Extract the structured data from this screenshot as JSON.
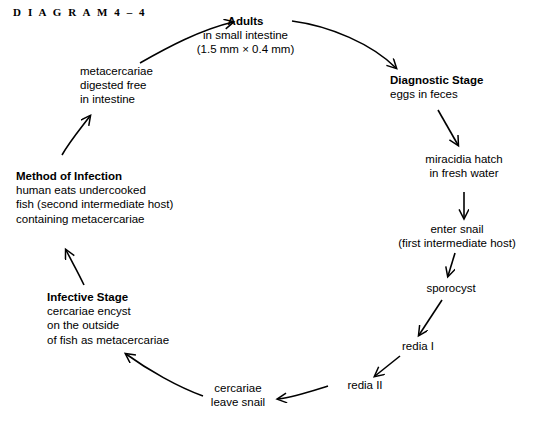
{
  "figure": {
    "label": "D I A G R A M   4 – 4"
  },
  "colors": {
    "background": "#ffffff",
    "ink": "#000000"
  },
  "nodes": [
    {
      "id": "adults",
      "title": "Adults",
      "lines": [
        "in small intestine",
        "(1.5 mm  ×  0.4 mm)"
      ]
    },
    {
      "id": "diagnostic-stage",
      "title": "Diagnostic Stage",
      "lines": [
        "eggs in feces"
      ]
    },
    {
      "id": "miracidia",
      "title": "",
      "lines": [
        "miracidia hatch",
        "in fresh water"
      ]
    },
    {
      "id": "enter-snail",
      "title": "",
      "lines": [
        "enter snail",
        "(first intermediate host)"
      ]
    },
    {
      "id": "sporocyst",
      "title": "",
      "lines": [
        "sporocyst"
      ]
    },
    {
      "id": "redia-1",
      "title": "",
      "lines": [
        "redia I"
      ]
    },
    {
      "id": "redia-2",
      "title": "",
      "lines": [
        "redia II"
      ]
    },
    {
      "id": "cercariae-leave-snail",
      "title": "",
      "lines": [
        "cercariae",
        "leave snail"
      ]
    },
    {
      "id": "infective-stage",
      "title": "Infective Stage",
      "lines": [
        "cercariae encyst",
        "on the outside",
        "of fish as metacercariae"
      ]
    },
    {
      "id": "method-of-infection",
      "title": "Method of Infection",
      "lines": [
        "human eats undercooked",
        "fish (second intermediate host)",
        "containing metacercariae"
      ]
    },
    {
      "id": "metacercariae-digested",
      "title": "",
      "lines": [
        "metacercariae",
        "digested free",
        "in intestine"
      ]
    }
  ],
  "node_text": {
    "adults": {
      "title": "Adults",
      "l0": "in small intestine",
      "l1": "(1.5 mm  ×  0.4 mm)"
    },
    "diagnostic_stage": {
      "title": "Diagnostic Stage",
      "l0": "eggs in feces"
    },
    "miracidia": {
      "l0": "miracidia hatch",
      "l1": "in fresh water"
    },
    "enter_snail": {
      "l0": "enter snail",
      "l1": "(first intermediate host)"
    },
    "sporocyst": {
      "l0": "sporocyst"
    },
    "redia_1": {
      "l0": "redia I"
    },
    "redia_2": {
      "l0": "redia II"
    },
    "cercariae_leave_snail": {
      "l0": "cercariae",
      "l1": "leave snail"
    },
    "infective_stage": {
      "title": "Infective Stage",
      "l0": "cercariae encyst",
      "l1": "on the outside",
      "l2": "of fish as metacercariae"
    },
    "method_of_infection": {
      "title": "Method of Infection",
      "l0": "human eats undercooked",
      "l1": "fish (second intermediate host)",
      "l2": "containing metacercariae"
    },
    "metacercariae_digested": {
      "l0": "metacercariae",
      "l1": "digested free",
      "l2": "in intestine"
    }
  },
  "arrows": [
    {
      "id": "metacercariae-to-adults",
      "from": "metacercariae-digested",
      "to": "adults"
    },
    {
      "id": "adults-to-diagnostic",
      "from": "adults",
      "to": "diagnostic-stage"
    },
    {
      "id": "diagnostic-to-miracidia",
      "from": "diagnostic-stage",
      "to": "miracidia"
    },
    {
      "id": "miracidia-to-enter-snail",
      "from": "miracidia",
      "to": "enter-snail"
    },
    {
      "id": "enter-snail-to-sporocyst",
      "from": "enter-snail",
      "to": "sporocyst"
    },
    {
      "id": "sporocyst-to-redia-1",
      "from": "sporocyst",
      "to": "redia-1"
    },
    {
      "id": "redia-1-to-redia-2",
      "from": "redia-1",
      "to": "redia-2"
    },
    {
      "id": "redia-2-to-cercariae",
      "from": "redia-2",
      "to": "cercariae-leave-snail"
    },
    {
      "id": "cercariae-to-infective",
      "from": "cercariae-leave-snail",
      "to": "infective-stage"
    },
    {
      "id": "infective-to-method",
      "from": "infective-stage",
      "to": "method-of-infection"
    },
    {
      "id": "method-to-metacercariae",
      "from": "method-of-infection",
      "to": "metacercariae-digested"
    }
  ]
}
